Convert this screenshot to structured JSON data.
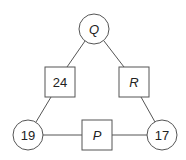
{
  "diagram": {
    "type": "triangle-number-puzzle",
    "colors": {
      "stroke": "#555555",
      "text": "#222222",
      "background": "#ffffff"
    },
    "nodes": [
      {
        "id": "Q",
        "shape": "circle",
        "label": "Q",
        "italic": true,
        "cx": 94,
        "cy": 29,
        "r": 15
      },
      {
        "id": "n24",
        "shape": "square",
        "label": "24",
        "italic": false,
        "x": 45,
        "y": 67,
        "w": 30,
        "h": 30
      },
      {
        "id": "R",
        "shape": "square",
        "label": "R",
        "italic": true,
        "x": 119,
        "y": 67,
        "w": 30,
        "h": 30
      },
      {
        "id": "n19",
        "shape": "circle",
        "label": "19",
        "italic": false,
        "cx": 28,
        "cy": 135,
        "r": 15
      },
      {
        "id": "P",
        "shape": "square",
        "label": "P",
        "italic": true,
        "x": 82,
        "y": 120,
        "w": 30,
        "h": 30
      },
      {
        "id": "n17",
        "shape": "circle",
        "label": "17",
        "italic": false,
        "cx": 162,
        "cy": 135,
        "r": 15
      }
    ],
    "edges": [
      {
        "from": "Q",
        "to": "n24"
      },
      {
        "from": "Q",
        "to": "R"
      },
      {
        "from": "n24",
        "to": "n19"
      },
      {
        "from": "R",
        "to": "n17"
      },
      {
        "from": "n19",
        "to": "P"
      },
      {
        "from": "P",
        "to": "n17"
      }
    ],
    "labels": {
      "Q": "Q",
      "n24": "24",
      "R": "R",
      "n19": "19",
      "P": "P",
      "n17": "17"
    }
  }
}
